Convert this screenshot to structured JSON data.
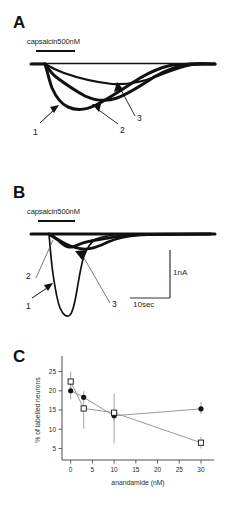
{
  "figure": {
    "panels": [
      {
        "id": "A",
        "letter": "A",
        "drug_label": "capsaicin500nM",
        "trace_labels": [
          "1",
          "2",
          "3"
        ]
      },
      {
        "id": "B",
        "letter": "B",
        "drug_label": "capsaicin500nM",
        "trace_labels": [
          "1",
          "2",
          "3"
        ],
        "scale_bars": {
          "vertical": "1nA",
          "horizontal": "10sec"
        }
      },
      {
        "id": "C",
        "letter": "C"
      }
    ]
  },
  "chart_data": {
    "type": "line",
    "title": "",
    "xlabel": "anandamide (nM)",
    "ylabel": "% of labelled neurons",
    "xlim": [
      -2,
      33
    ],
    "ylim": [
      2,
      28
    ],
    "xticks": [
      0,
      5,
      10,
      15,
      20,
      25,
      30
    ],
    "yticks": [
      5,
      10,
      15,
      20,
      25
    ],
    "xtick_labels": [
      "0",
      "5",
      "10",
      "15",
      "20",
      "25",
      "30"
    ],
    "ytick_labels": [
      "5",
      "10",
      "15",
      "20",
      "25"
    ],
    "grid": false,
    "legend": "none",
    "series": [
      {
        "name": "filled-circles",
        "marker": "filled-circle",
        "x": [
          0,
          3,
          10,
          30
        ],
        "values": [
          20.0,
          18.3,
          13.5,
          15.3
        ],
        "err_low": [
          2.3,
          1.6,
          1.3,
          1.3
        ],
        "err_high": [
          2.3,
          1.6,
          1.3,
          1.8
        ]
      },
      {
        "name": "open-squares",
        "marker": "open-square",
        "x": [
          0,
          3,
          10,
          30
        ],
        "values": [
          22.4,
          15.4,
          14.3,
          6.5
        ],
        "err_low": [
          2.6,
          5.3,
          8.0,
          1.5
        ],
        "err_high": [
          2.6,
          1.3,
          5.0,
          1.5
        ]
      }
    ]
  }
}
